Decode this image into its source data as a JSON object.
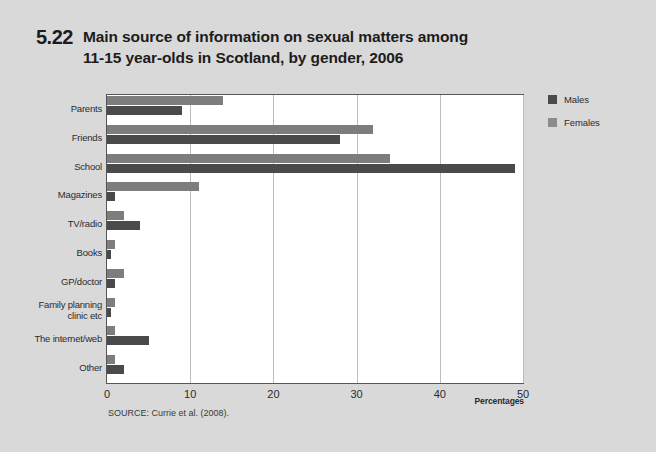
{
  "figure": {
    "number": "5.22",
    "title_line1": "Main source of information on sexual matters among",
    "title_line2": "11-15 year-olds in Scotland, by gender, 2006",
    "source": "SOURCE: Currie et al. (2008)."
  },
  "legend": {
    "position": "right",
    "items": [
      {
        "label": "Males",
        "color": "#4a4a4a"
      },
      {
        "label": "Females",
        "color": "#8b8b8b"
      }
    ]
  },
  "chart_data": {
    "type": "bar",
    "orientation": "horizontal",
    "title": "Main source of information on sexual matters among 11-15 year-olds in Scotland, by gender, 2006",
    "xlabel": "Percentages",
    "ylabel": "",
    "xlim": [
      0,
      50
    ],
    "xticks": [
      0,
      10,
      20,
      30,
      40,
      50
    ],
    "xtick_labels": [
      "0",
      "10",
      "20",
      "30",
      "40",
      "50"
    ],
    "grid": "vertical",
    "categories": [
      "Parents",
      "Friends",
      "School",
      "Magazines",
      "TV/radio",
      "Books",
      "GP/doctor",
      "Family planning clinic etc",
      "The internet/web",
      "Other"
    ],
    "category_label_lines": [
      [
        "Parents"
      ],
      [
        "Friends"
      ],
      [
        "School"
      ],
      [
        "Magazines"
      ],
      [
        "TV/radio"
      ],
      [
        "Books"
      ],
      [
        "GP/doctor"
      ],
      [
        "Family planning",
        "clinic etc"
      ],
      [
        "The internet/web"
      ],
      [
        "Other"
      ]
    ],
    "series": [
      {
        "name": "Males",
        "color": "#4a4a4a",
        "values": [
          9,
          28,
          49,
          1,
          4,
          0.5,
          1,
          0.5,
          5,
          2
        ]
      },
      {
        "name": "Females",
        "color": "#7d7d7d",
        "values": [
          14,
          32,
          34,
          11,
          2,
          1,
          2,
          1,
          1,
          1
        ]
      }
    ],
    "series_order_in_group": [
      "Females",
      "Males"
    ]
  },
  "axis": {
    "percentages_label": "Percentages"
  }
}
